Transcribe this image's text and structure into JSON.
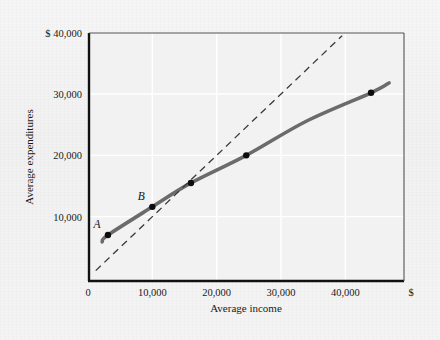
{
  "chart_data": {
    "type": "line",
    "title": "",
    "xlabel": "Average income",
    "ylabel": "Average expenditures",
    "xlim": [
      0,
      47500
    ],
    "ylim": [
      0,
      40000
    ],
    "grid": true,
    "legend": "none",
    "x_currency_symbol": "$",
    "y_currency_symbol": "$",
    "xticks": [
      {
        "value": 0,
        "label": "0"
      },
      {
        "value": 10000,
        "label": "10,000"
      },
      {
        "value": 20000,
        "label": "20,000"
      },
      {
        "value": 30000,
        "label": "30,000"
      },
      {
        "value": 40000,
        "label": "40,000"
      }
    ],
    "yticks": [
      {
        "value": 10000,
        "label": "10,000"
      },
      {
        "value": 20000,
        "label": "20,000"
      },
      {
        "value": 30000,
        "label": "30,000"
      },
      {
        "value": 40000,
        "label": "$ 40,000"
      }
    ],
    "series": [
      {
        "name": "consumption-function",
        "style": "solid-thick",
        "color": "#6b6b6b",
        "points": [
          {
            "x": 2200,
            "y": 5900
          },
          {
            "x": 3100,
            "y": 7000
          },
          {
            "x": 10000,
            "y": 11600
          },
          {
            "x": 16000,
            "y": 15500
          },
          {
            "x": 24600,
            "y": 20000
          },
          {
            "x": 34000,
            "y": 25600
          },
          {
            "x": 44000,
            "y": 30200
          },
          {
            "x": 46800,
            "y": 31800
          }
        ]
      },
      {
        "name": "forty-five-degree-line",
        "style": "dashed",
        "color": "#3a3a3a",
        "points": [
          {
            "x": 1200,
            "y": 1200
          },
          {
            "x": 39500,
            "y": 39500
          }
        ]
      }
    ],
    "markers": [
      {
        "label": "A",
        "x": 3100,
        "y": 7000,
        "label_position": "upper-left"
      },
      {
        "label": "B",
        "x": 10000,
        "y": 11600,
        "label_position": "upper-left"
      },
      {
        "label": "",
        "x": 16000,
        "y": 15500,
        "label_position": "none"
      },
      {
        "label": "",
        "x": 24600,
        "y": 20000,
        "label_position": "none"
      },
      {
        "label": "",
        "x": 44000,
        "y": 30200,
        "label_position": "none"
      }
    ],
    "annotations": [
      {
        "name": "x-axis-dollar-sign",
        "text": "$"
      }
    ]
  }
}
